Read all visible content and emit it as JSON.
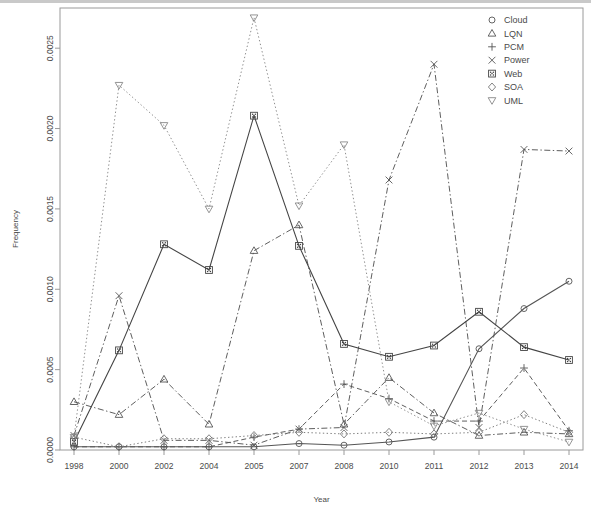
{
  "chart_data": {
    "type": "line",
    "title": "",
    "xlabel": "Year",
    "ylabel": "Frequency",
    "categories": [
      "1998",
      "2000",
      "2002",
      "2004",
      "2005",
      "2007",
      "2008",
      "2010",
      "2011",
      "2012",
      "2013",
      "2014"
    ],
    "ylim": [
      0.0,
      0.00275
    ],
    "yticks": [
      0.0,
      0.0005,
      0.001,
      0.0015,
      0.002,
      0.0025
    ],
    "ytick_labels": [
      "0.0000",
      "0.0005",
      "0.0010",
      "0.0015",
      "0.0020",
      "0.0025"
    ],
    "grid": false,
    "legend_position": "top-right",
    "series": [
      {
        "name": "Cloud",
        "marker": "circle",
        "linestyle": "solid",
        "color": "#555555",
        "values": [
          2e-05,
          2e-05,
          2e-05,
          2e-05,
          2e-05,
          4e-05,
          3e-05,
          5e-05,
          8e-05,
          0.00063,
          0.00088,
          0.00105
        ]
      },
      {
        "name": "LQN",
        "marker": "triangle-up",
        "linestyle": "dashdot",
        "color": "#555555",
        "values": [
          0.0003,
          0.00022,
          0.00044,
          0.00016,
          0.00124,
          0.0014,
          0.00016,
          0.00045,
          0.00023,
          9e-05,
          0.00011,
          0.0001
        ]
      },
      {
        "name": "PCM",
        "marker": "plus",
        "linestyle": "dashed",
        "color": "#555555",
        "values": [
          2e-05,
          2e-05,
          2e-05,
          2e-05,
          8e-05,
          0.00013,
          0.00041,
          0.00032,
          0.00018,
          0.00018,
          0.00051,
          0.00012
        ]
      },
      {
        "name": "Power",
        "marker": "cross",
        "linestyle": "dashdot",
        "color": "#555555",
        "values": [
          9e-05,
          0.00096,
          6e-05,
          6e-05,
          3e-05,
          0.00013,
          0.00014,
          0.00168,
          0.0024,
          0.00014,
          0.00187,
          0.00186
        ]
      },
      {
        "name": "Web",
        "marker": "square-dotted",
        "linestyle": "solid",
        "color": "#444444",
        "values": [
          5e-05,
          0.00062,
          0.00128,
          0.00112,
          0.00208,
          0.00127,
          0.00066,
          0.00058,
          0.00065,
          0.00086,
          0.00064,
          0.00056
        ]
      },
      {
        "name": "SOA",
        "marker": "diamond",
        "linestyle": "dotted",
        "color": "#777777",
        "values": [
          8e-05,
          2e-05,
          7e-05,
          7e-05,
          9e-05,
          0.00011,
          0.0001,
          0.00011,
          0.0001,
          0.00011,
          0.00022,
          0.00011
        ]
      },
      {
        "name": "UML",
        "marker": "triangle-down",
        "linestyle": "dotted",
        "color": "#888888",
        "values": [
          8e-05,
          0.00227,
          0.00202,
          0.0015,
          0.00269,
          0.00152,
          0.0019,
          0.0003,
          0.00015,
          0.00023,
          0.00013,
          5e-05
        ]
      }
    ]
  },
  "legend": {
    "entries": [
      {
        "label": "Cloud",
        "icon": "circle-marker-icon"
      },
      {
        "label": "LQN",
        "icon": "triangle-up-marker-icon"
      },
      {
        "label": "PCM",
        "icon": "plus-marker-icon"
      },
      {
        "label": "Power",
        "icon": "cross-marker-icon"
      },
      {
        "label": "Web",
        "icon": "square-marker-icon"
      },
      {
        "label": "SOA",
        "icon": "diamond-marker-icon"
      },
      {
        "label": "UML",
        "icon": "triangle-down-marker-icon"
      }
    ]
  }
}
